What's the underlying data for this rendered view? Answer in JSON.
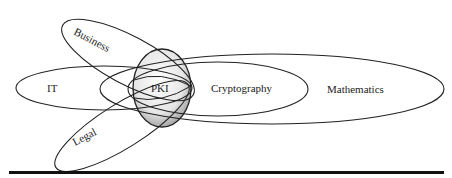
{
  "diagram": {
    "title": "",
    "center": {
      "id": "pki",
      "label": "PKI"
    },
    "nodes": [
      {
        "id": "business",
        "label": "Business"
      },
      {
        "id": "it",
        "label": "IT"
      },
      {
        "id": "legal",
        "label": "Legal"
      },
      {
        "id": "pki",
        "label": "PKI"
      },
      {
        "id": "cryptography",
        "label": "Cryptography"
      },
      {
        "id": "mathematics",
        "label": "Mathematics"
      }
    ],
    "relationships": [
      {
        "from": "business",
        "overlaps": "pki"
      },
      {
        "from": "it",
        "overlaps": "pki"
      },
      {
        "from": "legal",
        "overlaps": "pki"
      },
      {
        "from": "cryptography",
        "overlaps": "pki"
      },
      {
        "from": "mathematics",
        "contains": "cryptography"
      }
    ],
    "colors": {
      "stroke": "#222222",
      "pki_fill": "#d9d9d9",
      "rule": "#111111"
    }
  }
}
